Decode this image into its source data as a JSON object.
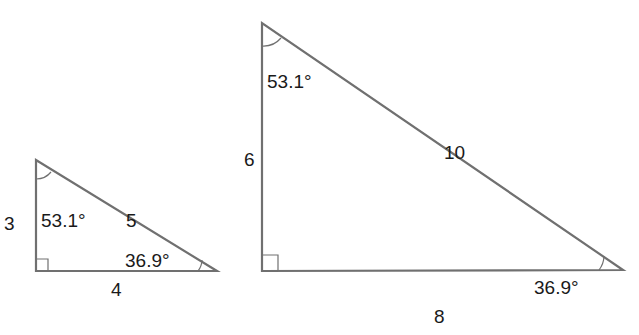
{
  "diagram": {
    "small_triangle": {
      "vertices": {
        "top": [
          36,
          160
        ],
        "right_angle": [
          36,
          271
        ],
        "right": [
          217,
          271
        ]
      },
      "sides": {
        "vertical": "3",
        "horizontal": "4",
        "hypotenuse": "5"
      },
      "angles": {
        "top": "53.1°",
        "right": "36.9°",
        "right_angle_marker": "90°"
      }
    },
    "large_triangle": {
      "vertices": {
        "top": [
          262,
          23
        ],
        "right_angle": [
          262,
          271
        ],
        "right": [
          623,
          270
        ]
      },
      "sides": {
        "vertical": "6",
        "horizontal": "8",
        "hypotenuse": "10"
      },
      "angles": {
        "top": "53.1°",
        "right": "36.9°",
        "right_angle_marker": "90°"
      }
    },
    "colors": {
      "stroke": "#707070",
      "text": "#1a1a1a",
      "background": "#ffffff"
    }
  }
}
